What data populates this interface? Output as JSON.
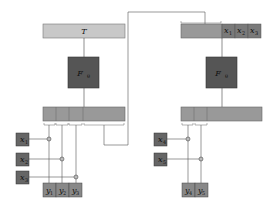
{
  "left": {
    "prompt_box_label": "T",
    "model_label": "F",
    "model_sub": "θ",
    "inputs": [
      {
        "label": "x",
        "sub": "1"
      },
      {
        "label": "x",
        "sub": "2"
      },
      {
        "label": "x",
        "sub": "3"
      }
    ],
    "outputs": [
      {
        "label": "y",
        "sub": "1"
      },
      {
        "label": "y",
        "sub": "2"
      },
      {
        "label": "y",
        "sub": "3"
      }
    ]
  },
  "right": {
    "appended_tokens": [
      {
        "label": "x",
        "sub": "1"
      },
      {
        "label": "x",
        "sub": "2"
      },
      {
        "label": "x",
        "sub": "3"
      }
    ],
    "model_label": "F",
    "model_sub": "θ",
    "inputs": [
      {
        "label": "x",
        "sub": "4"
      },
      {
        "label": "x",
        "sub": "5"
      }
    ],
    "outputs": [
      {
        "label": "y",
        "sub": "4"
      },
      {
        "label": "y",
        "sub": "5"
      }
    ]
  },
  "colors": {
    "light_box": "#c8c8c8",
    "mid_box": "#999999",
    "dark_box": "#555555",
    "token_box": "#7a7a7a",
    "line": "#444444"
  }
}
